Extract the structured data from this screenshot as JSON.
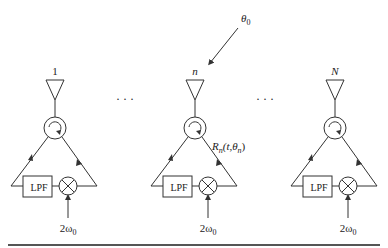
{
  "diagram": {
    "type": "retrodirective-array-block-diagram",
    "incident_angle_label": "θ",
    "incident_angle_subscript": "0",
    "ellipsis": "· · ·",
    "elements": [
      {
        "index_label": "1",
        "lpf_label": "LPF",
        "lo_label": "2ω",
        "lo_subscript": "0"
      },
      {
        "index_label": "n",
        "lpf_label": "LPF",
        "lo_label": "2ω",
        "lo_subscript": "0",
        "signal_label": "R",
        "signal_sub": "n",
        "signal_args": "(t,θ",
        "signal_args_sub": "n",
        "signal_close": ")"
      },
      {
        "index_label": "N",
        "lpf_label": "LPF",
        "lo_label": "2ω",
        "lo_subscript": "0"
      }
    ],
    "colors": {
      "line": "#333333",
      "text": "#222222",
      "rule": "#555555"
    }
  }
}
